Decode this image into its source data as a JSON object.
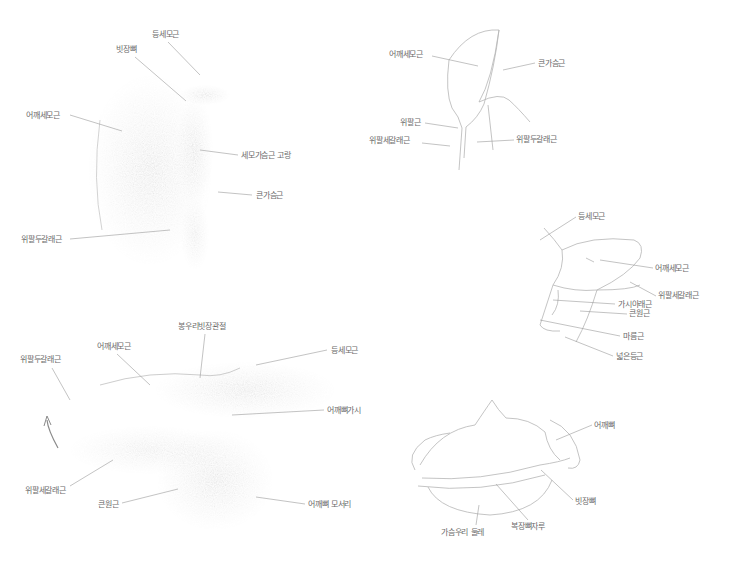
{
  "figures": [
    {
      "id": "shoulder-front",
      "labels": [
        {
          "text": "등세모근",
          "x": 152,
          "y": 30
        },
        {
          "text": "빗장뼈",
          "x": 116,
          "y": 45
        },
        {
          "text": "어깨세모근",
          "x": 26,
          "y": 111
        },
        {
          "text": "세모가슴근 고랑",
          "x": 241,
          "y": 151
        },
        {
          "text": "큰가슴근",
          "x": 256,
          "y": 191
        },
        {
          "text": "위팔두갈래근",
          "x": 21,
          "y": 235
        }
      ]
    },
    {
      "id": "shoulder-outline",
      "labels": [
        {
          "text": "어깨세모근",
          "x": 389,
          "y": 50
        },
        {
          "text": "큰가슴근",
          "x": 538,
          "y": 59
        },
        {
          "text": "위팔근",
          "x": 400,
          "y": 118
        },
        {
          "text": "위팔세갈래근",
          "x": 369,
          "y": 136
        },
        {
          "text": "위팔두갈래근",
          "x": 516,
          "y": 135
        }
      ]
    },
    {
      "id": "shoulder-back-outline",
      "labels": [
        {
          "text": "등세모근",
          "x": 578,
          "y": 212
        },
        {
          "text": "어깨세모근",
          "x": 655,
          "y": 264
        },
        {
          "text": "위팔세갈래근",
          "x": 658,
          "y": 291
        },
        {
          "text": "가시아래근",
          "x": 618,
          "y": 300
        },
        {
          "text": "큰원근",
          "x": 629,
          "y": 309
        },
        {
          "text": "마름근",
          "x": 623,
          "y": 332
        },
        {
          "text": "넓은등근",
          "x": 616,
          "y": 352
        }
      ]
    },
    {
      "id": "shoulder-back-shaded",
      "labels": [
        {
          "text": "봉우리빗장관절",
          "x": 178,
          "y": 322
        },
        {
          "text": "어깨세모근",
          "x": 97,
          "y": 342
        },
        {
          "text": "위팔두갈래근",
          "x": 20,
          "y": 355
        },
        {
          "text": "등세모근",
          "x": 331,
          "y": 346
        },
        {
          "text": "어깨뼈가시",
          "x": 327,
          "y": 406
        },
        {
          "text": "위팔세갈래근",
          "x": 25,
          "y": 486
        },
        {
          "text": "큰원근",
          "x": 98,
          "y": 500
        },
        {
          "text": "어깨뼈 모서리",
          "x": 308,
          "y": 500
        }
      ]
    },
    {
      "id": "shoulder-girdle",
      "labels": [
        {
          "text": "어깨뼈",
          "x": 594,
          "y": 421
        },
        {
          "text": "빗장뼈",
          "x": 575,
          "y": 497
        },
        {
          "text": "복장뼈자루",
          "x": 511,
          "y": 522
        },
        {
          "text": "가슴우리 둘레",
          "x": 441,
          "y": 528
        }
      ]
    }
  ],
  "colors": {
    "background": "#ffffff",
    "label_text": "#6a6a6a",
    "leader_line": "#9a9a9a",
    "sketch_line": "#b5b5b5",
    "shading": "#8a8a8a"
  }
}
